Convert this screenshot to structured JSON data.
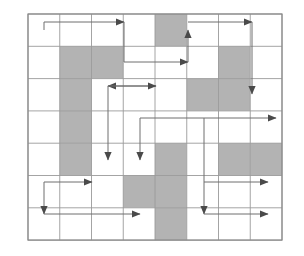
{
  "figure": {
    "type": "grid-diagram",
    "background_color": "#ffffff"
  },
  "grid": {
    "columns": 8,
    "rows": 7,
    "origin_x": 28,
    "origin_y": 14,
    "cell_width": 31.75,
    "cell_height": 32.3,
    "line_color": "#9a9a9a",
    "border_color": "#8a8a8a",
    "line_width": 0.9,
    "border_width": 1.2,
    "blocked_fill": "#b3b3b3",
    "open_fill": "#ffffff"
  },
  "blocked_cells": [
    {
      "col": 5,
      "row": 1
    },
    {
      "col": 2,
      "row": 2
    },
    {
      "col": 3,
      "row": 2
    },
    {
      "col": 7,
      "row": 2
    },
    {
      "col": 2,
      "row": 3
    },
    {
      "col": 6,
      "row": 3
    },
    {
      "col": 7,
      "row": 3
    },
    {
      "col": 2,
      "row": 4
    },
    {
      "col": 2,
      "row": 5
    },
    {
      "col": 5,
      "row": 5
    },
    {
      "col": 7,
      "row": 5
    },
    {
      "col": 8,
      "row": 5
    },
    {
      "col": 4,
      "row": 6
    },
    {
      "col": 5,
      "row": 6
    },
    {
      "col": 5,
      "row": 7
    }
  ],
  "path": {
    "stroke_color": "#6f6f6f",
    "stroke_width": 1.0,
    "arrow_color": "#4a4a4a",
    "segments": [
      {
        "id": "seg-r1-right",
        "name": "row1-left-to-center-right",
        "points": "44,30 44,22 124,22",
        "arrow": "right",
        "arrow_at": "124,22"
      },
      {
        "id": "seg-r1-down",
        "name": "row1-center-down-to-row2",
        "points": "124,22 124,62",
        "arrow": "none"
      },
      {
        "id": "seg-r2-right",
        "name": "row2-center-right-to-col6",
        "points": "124,62 188,62",
        "arrow": "right",
        "arrow_at": "188,62"
      },
      {
        "id": "seg-r2-up",
        "name": "row2-col6-up-to-row1",
        "points": "188,62 188,30",
        "arrow": "up",
        "arrow_at": "188,30"
      },
      {
        "id": "seg-r1b-right",
        "name": "row1-col6-right-to-col8",
        "points": "188,22 252,22",
        "arrow": "right",
        "arrow_at": "252,22"
      },
      {
        "id": "seg-r1b-down",
        "name": "col8-down-to-row3",
        "points": "252,22 252,94",
        "arrow": "down",
        "arrow_at": "252,94"
      },
      {
        "id": "seg-r3-left",
        "name": "row3-center-left",
        "points": "156,86 108,86",
        "arrow": "left",
        "arrow_at": "108,86"
      },
      {
        "id": "seg-r3-right",
        "name": "row3-center-right",
        "points": "108,86 156,86",
        "arrow": "right",
        "arrow_at": "156,86"
      },
      {
        "id": "seg-r3-downA",
        "name": "col3-down-to-row5",
        "points": "108,86 108,160",
        "arrow": "down",
        "arrow_at": "108,160"
      },
      {
        "id": "seg-r3-downB",
        "name": "col4-down-to-row5",
        "points": "140,118 140,160",
        "arrow": "down",
        "arrow_at": "140,160"
      },
      {
        "id": "seg-r4-right",
        "name": "row4-center-right-to-edge",
        "points": "140,118 276,118",
        "arrow": "right",
        "arrow_at": "276,118"
      },
      {
        "id": "seg-r4-col6-down",
        "name": "col6-down-to-row7",
        "points": "204,118 204,214",
        "arrow": "down",
        "arrow_at": "204,214"
      },
      {
        "id": "seg-r6-left-right",
        "name": "row6-left-right",
        "points": "44,182 92,182",
        "arrow": "right",
        "arrow_at": "92,182"
      },
      {
        "id": "seg-r6-left-down",
        "name": "col1-down-to-row7",
        "points": "44,182 44,214",
        "arrow": "down",
        "arrow_at": "44,214"
      },
      {
        "id": "seg-r7-right",
        "name": "row7-left-right",
        "points": "44,214 140,214",
        "arrow": "right",
        "arrow_at": "140,214"
      },
      {
        "id": "seg-r6-right",
        "name": "row6-right-segment",
        "points": "204,182 268,182",
        "arrow": "right",
        "arrow_at": "268,182"
      },
      {
        "id": "seg-r7-right2",
        "name": "row7-right-segment",
        "points": "204,214 268,214",
        "arrow": "right",
        "arrow_at": "268,214"
      }
    ],
    "arrow_count": 15
  }
}
